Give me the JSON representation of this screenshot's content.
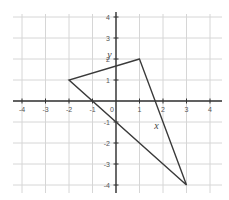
{
  "chart_data": {
    "type": "scatter",
    "title": "",
    "xlabel": "x",
    "ylabel": "y",
    "xlim": [
      -4.4,
      4.4
    ],
    "ylim": [
      -4.4,
      4.4
    ],
    "grid": true,
    "x_ticks": [
      -4,
      -3,
      -2,
      -1,
      0,
      1,
      2,
      3,
      4
    ],
    "y_ticks": [
      -4,
      -3,
      -2,
      -1,
      1,
      2,
      3,
      4
    ],
    "x_tick_labels": [
      "-4",
      "-3",
      "-2",
      "-1",
      "0",
      "1",
      "2",
      "3",
      "4"
    ],
    "y_tick_labels": [
      "-4",
      "-3",
      "-2",
      "-1",
      "1",
      "2",
      "3",
      "4"
    ],
    "series": [
      {
        "name": "triangle",
        "closed": true,
        "points": [
          {
            "x": 1,
            "y": 2
          },
          {
            "x": -2,
            "y": 1
          },
          {
            "x": 3,
            "y": -4
          }
        ]
      }
    ],
    "annotations": [
      {
        "text": "y",
        "x": -0.2,
        "y": 2.2
      },
      {
        "text": "x",
        "x": 1.8,
        "y": -1.2
      }
    ]
  },
  "colors": {
    "grid": "#d6d6d6",
    "axis": "#333333",
    "shape": "#3a3a3a",
    "label": "#555555"
  }
}
